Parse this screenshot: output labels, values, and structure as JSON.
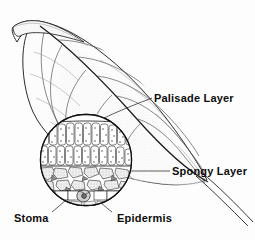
{
  "figure": {
    "background_color": "#fdfdfd",
    "ink_color": "#1a1a1a",
    "width": 255,
    "height": 240
  },
  "labels": {
    "palisade": "Palisade Layer",
    "spongy": "Spongy Layer",
    "stoma": "Stoma",
    "epidermis": "Epidermis"
  },
  "diagram": {
    "leaf_name": "leaf-blade",
    "petiole_name": "leaf-petiole",
    "midrib_name": "leaf-midrib",
    "inset_name": "magnified-cross-section",
    "layers": [
      {
        "name": "palisade-layer",
        "label": "Palisade Layer",
        "rows": 2,
        "cell_count": 26
      },
      {
        "name": "spongy-layer",
        "label": "Spongy Layer",
        "cell_count": 22
      },
      {
        "name": "epidermis-layer",
        "label": "Epidermis",
        "cell_count": 9
      },
      {
        "name": "stoma",
        "label": "Stoma",
        "count": 1
      }
    ]
  }
}
